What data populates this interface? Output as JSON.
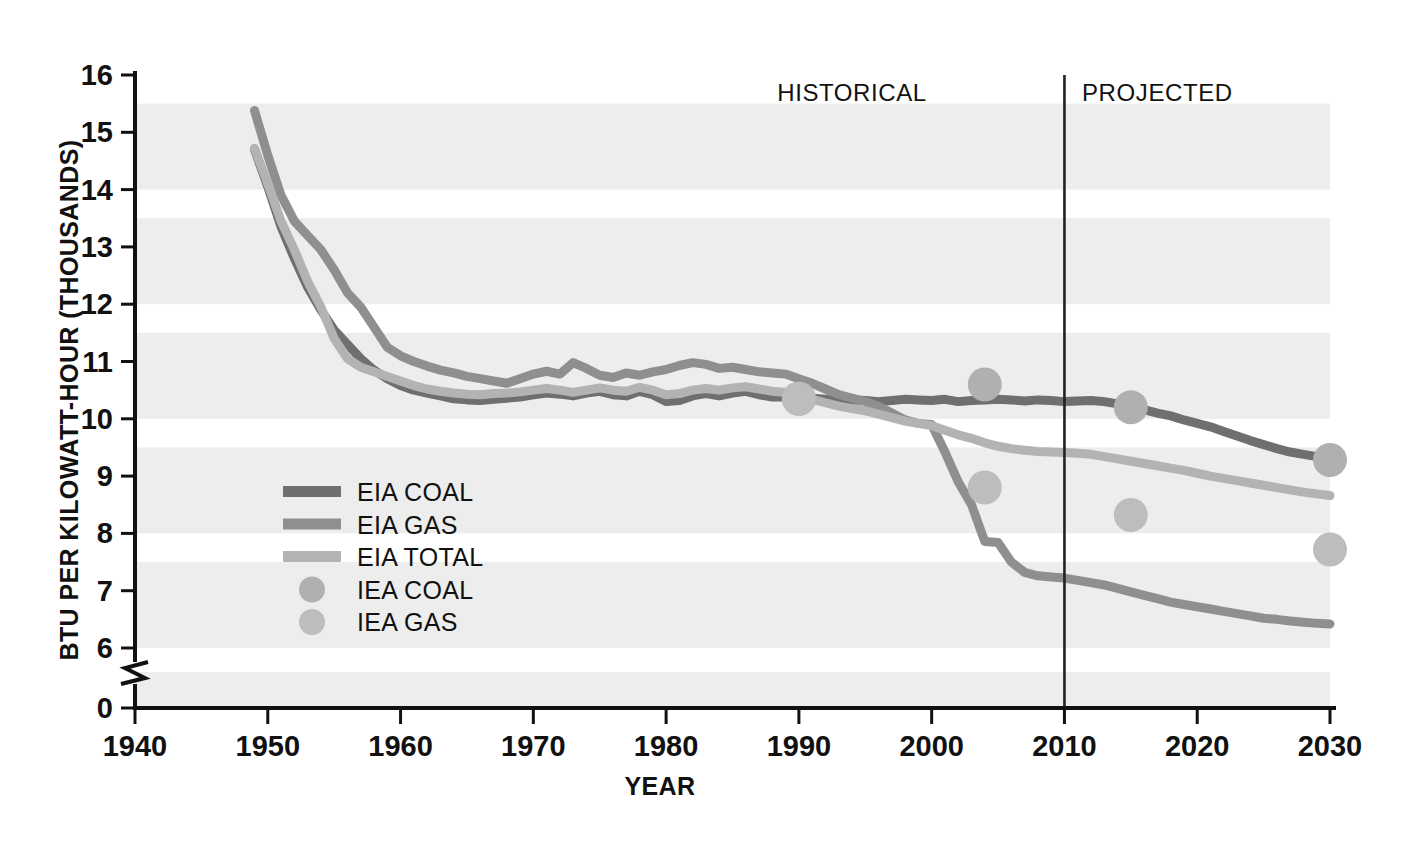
{
  "chart_data": {
    "type": "line",
    "title": "",
    "xlabel": "YEAR",
    "ylabel": "BTU PER KILOWATT-HOUR (THOUSANDS)",
    "xlim": [
      1940,
      2030
    ],
    "ylim": [
      0,
      16
    ],
    "y_axis_break": {
      "between": [
        0,
        6
      ],
      "note": "axis broken between 0 and 6"
    },
    "grid": "horizontal alternating shaded bands",
    "legend_position": "inside lower-left",
    "x_ticks": [
      "1940",
      "1950",
      "1960",
      "1970",
      "1980",
      "1990",
      "2000",
      "2010",
      "2020",
      "2030"
    ],
    "y_ticks": [
      "0",
      "6",
      "7",
      "8",
      "9",
      "10",
      "11",
      "12",
      "13",
      "14",
      "15",
      "16"
    ],
    "annotations": [
      {
        "name": "historical-label",
        "text": "HISTORICAL",
        "x": 1994,
        "y": 15.55
      },
      {
        "name": "projected-label",
        "text": "PROJECTED",
        "x": 2017,
        "y": 15.55
      },
      {
        "name": "historical-projected-divider",
        "text": "",
        "x": 2010,
        "y": 16
      }
    ],
    "divider_year": 2010,
    "colors": {
      "eia_coal": "#6f6f6f",
      "eia_gas": "#8f8f8f",
      "eia_total": "#b3b3b3",
      "iea_coal": "#b0b0b0",
      "iea_gas": "#bdbdbd",
      "band": "#ededed",
      "axis": "#111111"
    },
    "legend": [
      {
        "label": "EIA COAL",
        "marker": "line",
        "color": "#6f6f6f"
      },
      {
        "label": "EIA GAS",
        "marker": "line",
        "color": "#8f8f8f"
      },
      {
        "label": "EIA TOTAL",
        "marker": "line",
        "color": "#b3b3b3"
      },
      {
        "label": "IEA COAL",
        "marker": "dot",
        "color": "#b0b0b0"
      },
      {
        "label": "IEA GAS",
        "marker": "dot",
        "color": "#bdbdbd"
      }
    ],
    "series": [
      {
        "name": "EIA COAL",
        "type": "line",
        "color": "#6f6f6f",
        "points": [
          [
            1949,
            14.7
          ],
          [
            1950,
            14.05
          ],
          [
            1951,
            13.35
          ],
          [
            1952,
            12.8
          ],
          [
            1953,
            12.3
          ],
          [
            1954,
            11.9
          ],
          [
            1955,
            11.55
          ],
          [
            1956,
            11.3
          ],
          [
            1957,
            11.05
          ],
          [
            1958,
            10.85
          ],
          [
            1959,
            10.7
          ],
          [
            1960,
            10.58
          ],
          [
            1961,
            10.5
          ],
          [
            1962,
            10.45
          ],
          [
            1963,
            10.4
          ],
          [
            1964,
            10.35
          ],
          [
            1965,
            10.33
          ],
          [
            1966,
            10.32
          ],
          [
            1967,
            10.34
          ],
          [
            1968,
            10.36
          ],
          [
            1969,
            10.38
          ],
          [
            1970,
            10.42
          ],
          [
            1971,
            10.45
          ],
          [
            1972,
            10.43
          ],
          [
            1973,
            10.4
          ],
          [
            1974,
            10.45
          ],
          [
            1975,
            10.48
          ],
          [
            1976,
            10.42
          ],
          [
            1977,
            10.4
          ],
          [
            1978,
            10.48
          ],
          [
            1979,
            10.42
          ],
          [
            1980,
            10.3
          ],
          [
            1981,
            10.32
          ],
          [
            1982,
            10.4
          ],
          [
            1983,
            10.44
          ],
          [
            1984,
            10.4
          ],
          [
            1985,
            10.45
          ],
          [
            1986,
            10.48
          ],
          [
            1987,
            10.42
          ],
          [
            1988,
            10.38
          ],
          [
            1989,
            10.38
          ],
          [
            1990,
            10.35
          ],
          [
            1991,
            10.36
          ],
          [
            1992,
            10.34
          ],
          [
            1993,
            10.36
          ],
          [
            1994,
            10.33
          ],
          [
            1995,
            10.32
          ],
          [
            1996,
            10.3
          ],
          [
            1997,
            10.32
          ],
          [
            1998,
            10.34
          ],
          [
            1999,
            10.33
          ],
          [
            2000,
            10.32
          ],
          [
            2001,
            10.34
          ],
          [
            2002,
            10.3
          ],
          [
            2003,
            10.32
          ],
          [
            2004,
            10.33
          ],
          [
            2005,
            10.34
          ],
          [
            2006,
            10.33
          ],
          [
            2007,
            10.31
          ],
          [
            2008,
            10.33
          ],
          [
            2009,
            10.32
          ],
          [
            2010,
            10.3
          ],
          [
            2011,
            10.31
          ],
          [
            2012,
            10.32
          ],
          [
            2013,
            10.3
          ],
          [
            2014,
            10.26
          ],
          [
            2015,
            10.22
          ],
          [
            2016,
            10.16
          ],
          [
            2017,
            10.1
          ],
          [
            2018,
            10.05
          ],
          [
            2019,
            9.98
          ],
          [
            2020,
            9.92
          ],
          [
            2021,
            9.86
          ],
          [
            2022,
            9.78
          ],
          [
            2023,
            9.7
          ],
          [
            2024,
            9.62
          ],
          [
            2025,
            9.55
          ],
          [
            2026,
            9.48
          ],
          [
            2027,
            9.42
          ],
          [
            2028,
            9.38
          ],
          [
            2029,
            9.34
          ],
          [
            2030,
            9.3
          ]
        ]
      },
      {
        "name": "EIA GAS",
        "type": "line",
        "color": "#8f8f8f",
        "points": [
          [
            1949,
            15.38
          ],
          [
            1950,
            14.6
          ],
          [
            1951,
            13.9
          ],
          [
            1952,
            13.45
          ],
          [
            1953,
            13.2
          ],
          [
            1954,
            12.95
          ],
          [
            1955,
            12.6
          ],
          [
            1956,
            12.2
          ],
          [
            1957,
            11.95
          ],
          [
            1958,
            11.6
          ],
          [
            1959,
            11.25
          ],
          [
            1960,
            11.1
          ],
          [
            1961,
            11.0
          ],
          [
            1962,
            10.92
          ],
          [
            1963,
            10.85
          ],
          [
            1964,
            10.8
          ],
          [
            1965,
            10.74
          ],
          [
            1966,
            10.7
          ],
          [
            1967,
            10.66
          ],
          [
            1968,
            10.62
          ],
          [
            1969,
            10.7
          ],
          [
            1970,
            10.78
          ],
          [
            1971,
            10.83
          ],
          [
            1972,
            10.78
          ],
          [
            1973,
            10.98
          ],
          [
            1974,
            10.88
          ],
          [
            1975,
            10.76
          ],
          [
            1976,
            10.72
          ],
          [
            1977,
            10.8
          ],
          [
            1978,
            10.76
          ],
          [
            1979,
            10.82
          ],
          [
            1980,
            10.86
          ],
          [
            1981,
            10.93
          ],
          [
            1982,
            10.98
          ],
          [
            1983,
            10.95
          ],
          [
            1984,
            10.88
          ],
          [
            1985,
            10.9
          ],
          [
            1986,
            10.86
          ],
          [
            1987,
            10.82
          ],
          [
            1988,
            10.8
          ],
          [
            1989,
            10.78
          ],
          [
            1990,
            10.7
          ],
          [
            1991,
            10.62
          ],
          [
            1992,
            10.52
          ],
          [
            1993,
            10.42
          ],
          [
            1994,
            10.36
          ],
          [
            1995,
            10.3
          ],
          [
            1996,
            10.22
          ],
          [
            1997,
            10.1
          ],
          [
            1998,
            9.98
          ],
          [
            1999,
            9.92
          ],
          [
            2000,
            9.9
          ],
          [
            2001,
            9.42
          ],
          [
            2002,
            8.9
          ],
          [
            2003,
            8.5
          ],
          [
            2004,
            7.86
          ],
          [
            2005,
            7.84
          ],
          [
            2006,
            7.5
          ],
          [
            2007,
            7.32
          ],
          [
            2008,
            7.26
          ],
          [
            2009,
            7.24
          ],
          [
            2010,
            7.22
          ],
          [
            2011,
            7.18
          ],
          [
            2012,
            7.14
          ],
          [
            2013,
            7.1
          ],
          [
            2014,
            7.04
          ],
          [
            2015,
            6.98
          ],
          [
            2016,
            6.92
          ],
          [
            2017,
            6.86
          ],
          [
            2018,
            6.8
          ],
          [
            2019,
            6.76
          ],
          [
            2020,
            6.72
          ],
          [
            2021,
            6.68
          ],
          [
            2022,
            6.64
          ],
          [
            2023,
            6.6
          ],
          [
            2024,
            6.56
          ],
          [
            2025,
            6.52
          ],
          [
            2026,
            6.5
          ],
          [
            2027,
            6.47
          ],
          [
            2028,
            6.45
          ],
          [
            2029,
            6.43
          ],
          [
            2030,
            6.42
          ]
        ]
      },
      {
        "name": "EIA TOTAL",
        "type": "line",
        "color": "#b3b3b3",
        "points": [
          [
            1949,
            14.72
          ],
          [
            1950,
            14.1
          ],
          [
            1951,
            13.45
          ],
          [
            1952,
            12.95
          ],
          [
            1953,
            12.4
          ],
          [
            1954,
            11.95
          ],
          [
            1955,
            11.4
          ],
          [
            1956,
            11.05
          ],
          [
            1957,
            10.9
          ],
          [
            1958,
            10.82
          ],
          [
            1959,
            10.74
          ],
          [
            1960,
            10.66
          ],
          [
            1961,
            10.58
          ],
          [
            1962,
            10.52
          ],
          [
            1963,
            10.48
          ],
          [
            1964,
            10.45
          ],
          [
            1965,
            10.43
          ],
          [
            1966,
            10.42
          ],
          [
            1967,
            10.44
          ],
          [
            1968,
            10.45
          ],
          [
            1969,
            10.47
          ],
          [
            1970,
            10.5
          ],
          [
            1971,
            10.53
          ],
          [
            1972,
            10.5
          ],
          [
            1973,
            10.46
          ],
          [
            1974,
            10.5
          ],
          [
            1975,
            10.54
          ],
          [
            1976,
            10.5
          ],
          [
            1977,
            10.48
          ],
          [
            1978,
            10.55
          ],
          [
            1979,
            10.5
          ],
          [
            1980,
            10.42
          ],
          [
            1981,
            10.44
          ],
          [
            1982,
            10.5
          ],
          [
            1983,
            10.53
          ],
          [
            1984,
            10.5
          ],
          [
            1985,
            10.54
          ],
          [
            1986,
            10.56
          ],
          [
            1987,
            10.52
          ],
          [
            1988,
            10.48
          ],
          [
            1989,
            10.46
          ],
          [
            1990,
            10.4
          ],
          [
            1991,
            10.34
          ],
          [
            1992,
            10.28
          ],
          [
            1993,
            10.22
          ],
          [
            1994,
            10.18
          ],
          [
            1995,
            10.14
          ],
          [
            1996,
            10.08
          ],
          [
            1997,
            10.02
          ],
          [
            1998,
            9.96
          ],
          [
            1999,
            9.92
          ],
          [
            2000,
            9.88
          ],
          [
            2001,
            9.8
          ],
          [
            2002,
            9.72
          ],
          [
            2003,
            9.66
          ],
          [
            2004,
            9.58
          ],
          [
            2005,
            9.52
          ],
          [
            2006,
            9.48
          ],
          [
            2007,
            9.45
          ],
          [
            2008,
            9.43
          ],
          [
            2009,
            9.42
          ],
          [
            2010,
            9.41
          ],
          [
            2011,
            9.4
          ],
          [
            2012,
            9.38
          ],
          [
            2013,
            9.34
          ],
          [
            2014,
            9.3
          ],
          [
            2015,
            9.26
          ],
          [
            2016,
            9.22
          ],
          [
            2017,
            9.18
          ],
          [
            2018,
            9.14
          ],
          [
            2019,
            9.1
          ],
          [
            2020,
            9.05
          ],
          [
            2021,
            9.0
          ],
          [
            2022,
            8.96
          ],
          [
            2023,
            8.92
          ],
          [
            2024,
            8.88
          ],
          [
            2025,
            8.84
          ],
          [
            2026,
            8.8
          ],
          [
            2027,
            8.76
          ],
          [
            2028,
            8.72
          ],
          [
            2029,
            8.69
          ],
          [
            2030,
            8.66
          ]
        ]
      },
      {
        "name": "IEA COAL",
        "type": "scatter",
        "color": "#b0b0b0",
        "points": [
          [
            1990,
            10.35
          ],
          [
            2004,
            10.6
          ],
          [
            2015,
            10.2
          ],
          [
            2030,
            9.28
          ]
        ]
      },
      {
        "name": "IEA GAS",
        "type": "scatter",
        "color": "#bdbdbd",
        "points": [
          [
            1990,
            10.35
          ],
          [
            2004,
            8.8
          ],
          [
            2015,
            8.32
          ],
          [
            2030,
            7.72
          ]
        ]
      }
    ]
  }
}
